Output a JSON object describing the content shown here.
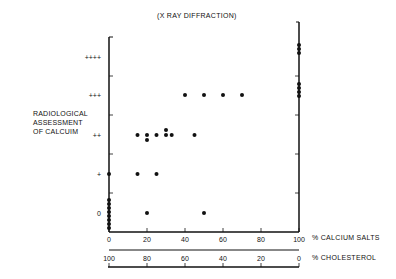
{
  "chart_data": {
    "type": "scatter",
    "title": "(X RAY DIFFRACTION)",
    "ylabel": "RADIOLOGICAL ASSESSMENT OF CALCUIM",
    "xlabel": "% CALCIUM SALTS",
    "x2label": "% CHOLESTEROL",
    "xlim": [
      0,
      100
    ],
    "xticks": [
      0,
      20,
      40,
      60,
      80,
      100
    ],
    "x2ticks": [
      100,
      80,
      60,
      40,
      20,
      0
    ],
    "ycategories": [
      "0",
      "+",
      "++",
      "+++",
      "++++"
    ],
    "points": [
      {
        "x": 0,
        "y": "0"
      },
      {
        "x": 0,
        "y": "0"
      },
      {
        "x": 0,
        "y": "0"
      },
      {
        "x": 0,
        "y": "0"
      },
      {
        "x": 0,
        "y": "0"
      },
      {
        "x": 0,
        "y": "0"
      },
      {
        "x": 0,
        "y": "0"
      },
      {
        "x": 0,
        "y": "0"
      },
      {
        "x": 0,
        "y": "+"
      },
      {
        "x": 15,
        "y": "+"
      },
      {
        "x": 25,
        "y": "+"
      },
      {
        "x": 20,
        "y": "0"
      },
      {
        "x": 50,
        "y": "0"
      },
      {
        "x": 15,
        "y": "++"
      },
      {
        "x": 20,
        "y": "++"
      },
      {
        "x": 20,
        "y": "++",
        "offset": -1
      },
      {
        "x": 25,
        "y": "++"
      },
      {
        "x": 30,
        "y": "++"
      },
      {
        "x": 30,
        "y": "++",
        "offset": 1
      },
      {
        "x": 33,
        "y": "++"
      },
      {
        "x": 45,
        "y": "++"
      },
      {
        "x": 40,
        "y": "+++"
      },
      {
        "x": 50,
        "y": "+++"
      },
      {
        "x": 60,
        "y": "+++"
      },
      {
        "x": 70,
        "y": "+++"
      },
      {
        "x": 100,
        "y": "+++"
      },
      {
        "x": 100,
        "y": "+++"
      },
      {
        "x": 100,
        "y": "+++"
      },
      {
        "x": 100,
        "y": "+++"
      },
      {
        "x": 100,
        "y": "++++"
      },
      {
        "x": 100,
        "y": "++++"
      },
      {
        "x": 100,
        "y": "++++"
      }
    ],
    "grid": false,
    "legend": null
  },
  "labels": {
    "title": "(X RAY DIFFRACTION)",
    "ylabel_line1": "RADIOLOGICAL",
    "ylabel_line2": "ASSESSMENT",
    "ylabel_line3": "OF CALCUIM",
    "xlabel": "% CALCIUM SALTS",
    "x2label": "% CHOLESTEROL"
  }
}
